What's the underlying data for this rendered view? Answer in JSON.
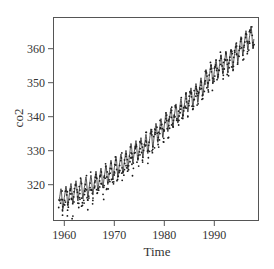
{
  "chart_data": {
    "type": "line",
    "title": "",
    "xlabel": "Time",
    "ylabel": "co2",
    "xlim": [
      1957.8,
      1998.8
    ],
    "ylim": [
      309.6,
      369.3
    ],
    "x_ticks": [
      1960,
      1970,
      1980,
      1990
    ],
    "x_tick_labels": [
      "1960",
      "1970",
      "1980",
      "1990"
    ],
    "y_ticks": [
      320,
      330,
      340,
      350,
      360
    ],
    "y_tick_labels": [
      "320",
      "330",
      "340",
      "350",
      "360"
    ],
    "grid": false,
    "legend": null,
    "series": [
      {
        "name": "co2 (monthly, line)",
        "style": "line",
        "start_year": 1959,
        "years": [
          1959,
          1960,
          1961,
          1962,
          1963,
          1964,
          1965,
          1966,
          1967,
          1968,
          1969,
          1970,
          1971,
          1972,
          1973,
          1974,
          1975,
          1976,
          1977,
          1978,
          1979,
          1980,
          1981,
          1982,
          1983,
          1984,
          1985,
          1986,
          1987,
          1988,
          1989,
          1990,
          1991,
          1992,
          1993,
          1994,
          1995,
          1996,
          1997
        ],
        "annual_mean": [
          315.83,
          316.75,
          317.49,
          318.3,
          318.83,
          319.42,
          319.87,
          321.21,
          322.02,
          322.89,
          324.46,
          325.52,
          326.16,
          327.29,
          329.51,
          330.08,
          330.99,
          331.98,
          333.73,
          335.34,
          336.68,
          338.52,
          339.76,
          340.96,
          342.61,
          344.25,
          345.73,
          346.97,
          348.75,
          351.31,
          352.75,
          354.04,
          355.48,
          356.29,
          356.99,
          358.88,
          360.9,
          362.58,
          363.84
        ],
        "seasonal_offsets_jan_to_dec": [
          -0.05,
          0.61,
          1.38,
          2.51,
          3.0,
          2.34,
          0.81,
          -1.24,
          -3.06,
          -3.24,
          -2.05,
          -0.98
        ]
      },
      {
        "name": "co2 (points)",
        "style": "points",
        "note": "scattered dots around the trend, denser below the line in early years"
      }
    ]
  },
  "colors": {
    "line": "#2a2a2a",
    "points": "#1a1a1a",
    "axis": "#555555",
    "text": "#333333",
    "background": "#ffffff"
  }
}
